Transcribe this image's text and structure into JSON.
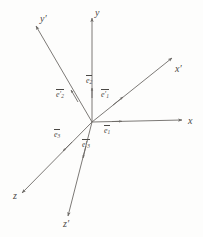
{
  "figure": {
    "background_color": "#fdfdfc",
    "line_color": "#6d6a66",
    "text_color": "#4a4845",
    "width": 203,
    "height": 237,
    "origin": {
      "x": 92,
      "y": 122
    }
  },
  "axes": [
    {
      "id": "x",
      "label": "x",
      "label_pos": {
        "x": 188,
        "y": 116
      },
      "from": {
        "x": 92,
        "y": 122
      },
      "to": {
        "x": 182,
        "y": 120
      },
      "primed": false
    },
    {
      "id": "y",
      "label": "y",
      "label_pos": {
        "x": 95,
        "y": 8
      },
      "from": {
        "x": 92,
        "y": 122
      },
      "to": {
        "x": 92,
        "y": 18
      },
      "primed": false
    },
    {
      "id": "z",
      "label": "z",
      "label_pos": {
        "x": 13,
        "y": 191
      },
      "from": {
        "x": 92,
        "y": 122
      },
      "to": {
        "x": 22,
        "y": 193
      },
      "primed": false
    },
    {
      "id": "x-prime",
      "label": "x′",
      "label_pos": {
        "x": 175,
        "y": 64
      },
      "from": {
        "x": 92,
        "y": 122
      },
      "to": {
        "x": 172,
        "y": 58
      },
      "primed": true
    },
    {
      "id": "y-prime",
      "label": "y′",
      "label_pos": {
        "x": 40,
        "y": 14
      },
      "from": {
        "x": 92,
        "y": 122
      },
      "to": {
        "x": 36,
        "y": 26
      },
      "primed": true
    },
    {
      "id": "z-prime",
      "label": "z′",
      "label_pos": {
        "x": 63,
        "y": 219
      },
      "from": {
        "x": 92,
        "y": 122
      },
      "to": {
        "x": 68,
        "y": 216
      },
      "primed": true
    }
  ],
  "basis_vectors": [
    {
      "id": "e1",
      "base": "e",
      "index": "1",
      "prime": "",
      "label_pos": {
        "x": 104,
        "y": 125
      },
      "from": {
        "x": 92,
        "y": 122
      },
      "to": {
        "x": 122,
        "y": 121
      },
      "along_axis": "x"
    },
    {
      "id": "e2",
      "base": "e",
      "index": "2",
      "prime": "",
      "label_pos": {
        "x": 86,
        "y": 75
      },
      "from": {
        "x": 92,
        "y": 122
      },
      "to": {
        "x": 92,
        "y": 88
      },
      "along_axis": "y"
    },
    {
      "id": "e3",
      "base": "e",
      "index": "3",
      "prime": "",
      "label_pos": {
        "x": 54,
        "y": 129
      },
      "from": {
        "x": 92,
        "y": 122
      },
      "to": {
        "x": 62,
        "y": 152
      },
      "along_axis": "z"
    },
    {
      "id": "e1-prime",
      "base": "e",
      "index": "1",
      "prime": "′",
      "label_pos": {
        "x": 101,
        "y": 89
      },
      "from": {
        "x": 92,
        "y": 122
      },
      "to": {
        "x": 123,
        "y": 97
      },
      "along_axis": "x-prime"
    },
    {
      "id": "e2-prime",
      "base": "e",
      "index": "2",
      "prime": "′",
      "label_pos": {
        "x": 56,
        "y": 89
      },
      "from": {
        "x": 92,
        "y": 122
      },
      "to": {
        "x": 71,
        "y": 90
      },
      "along_axis": "y-prime"
    },
    {
      "id": "e3-prime",
      "base": "e",
      "index": "3",
      "prime": "′",
      "label_pos": {
        "x": 82,
        "y": 139
      },
      "from": {
        "x": 92,
        "y": 122
      },
      "to": {
        "x": 83,
        "y": 158
      },
      "along_axis": "z-prime"
    }
  ]
}
